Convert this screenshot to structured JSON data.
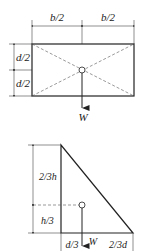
{
  "figure_rectangle": {
    "shape": "rectangle",
    "width_labels": [
      "b/2",
      "b/2"
    ],
    "height_labels": [
      "d/2",
      "d/2"
    ],
    "load_label": "W",
    "centroid": "center"
  },
  "figure_triangle": {
    "shape": "right-triangle",
    "height_labels": [
      "2/3h",
      "h/3"
    ],
    "base_labels": [
      "d/3",
      "2/3d"
    ],
    "load_label": "W",
    "centroid": "one-third from base and vertical edge"
  },
  "colors": {
    "line": "#222222",
    "dashed": "#555555",
    "dimension": "#444444"
  }
}
